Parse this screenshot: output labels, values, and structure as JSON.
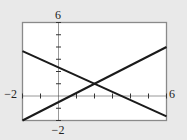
{
  "chart_data": {
    "type": "line",
    "title": "",
    "xlabel": "",
    "ylabel": "",
    "xlim": [
      -2,
      6
    ],
    "ylim": [
      -2,
      6
    ],
    "x_tick_step": 1,
    "y_tick_step": 1,
    "grid": false,
    "legend": null,
    "tick_labels": {
      "x_min": "−2",
      "x_max": "6",
      "y_min": "−2",
      "y_max": "6"
    },
    "series": [
      {
        "name": "line-decreasing",
        "equation": "y = -2/3 x + 7/3",
        "x": [
          -2,
          6
        ],
        "y": [
          3.67,
          -1.67
        ]
      },
      {
        "name": "line-increasing",
        "equation": "y = 3/4 x - 1/2",
        "x": [
          -2,
          6
        ],
        "y": [
          -2,
          4
        ]
      }
    ],
    "annotations": [
      {
        "label": "intersection",
        "x": 2,
        "y": 1
      }
    ]
  },
  "colors": {
    "background": "#e9e9e9",
    "plot_area": "#ffffff",
    "frame": "#8a8a8a",
    "axis": "#333333",
    "line": "#1a1a1a"
  }
}
